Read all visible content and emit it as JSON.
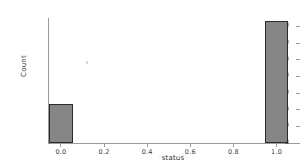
{
  "chart_data": {
    "type": "bar",
    "title": "",
    "subtitle": "",
    "xlabel": "status",
    "ylabel": "Count",
    "categories": [
      "0.0",
      "1.0"
    ],
    "x": [
      0.0,
      1.0
    ],
    "values": [
      47,
      146
    ],
    "bar_width": 0.11,
    "xlim": [
      -0.06,
      1.09
    ],
    "ylim": [
      0,
      150
    ],
    "xticks": [
      "0.0",
      "0.2",
      "0.4",
      "0.6",
      "0.8",
      "1.0"
    ],
    "xtick_values": [
      0.0,
      0.2,
      0.4,
      0.6,
      0.8,
      1.0
    ],
    "yticks": [
      "0",
      "20",
      "40",
      "60",
      "80",
      "100",
      "120",
      "140"
    ],
    "ytick_values": [
      0,
      20,
      40,
      60,
      80,
      100,
      120,
      140
    ],
    "grid": false,
    "legend": null,
    "legend_position": "none",
    "annotations": [],
    "bar_fill_color": "#868686",
    "bar_edge_color": "#2b2b2b",
    "axis_color": "#9a9a9a",
    "tick_label_color": "#3a3a3a",
    "background_color": "#ffffff",
    "bars": [
      {
        "label": "0.0",
        "x": 0.0,
        "value": 47
      },
      {
        "label": "1.0",
        "x": 1.0,
        "value": 146
      }
    ]
  }
}
